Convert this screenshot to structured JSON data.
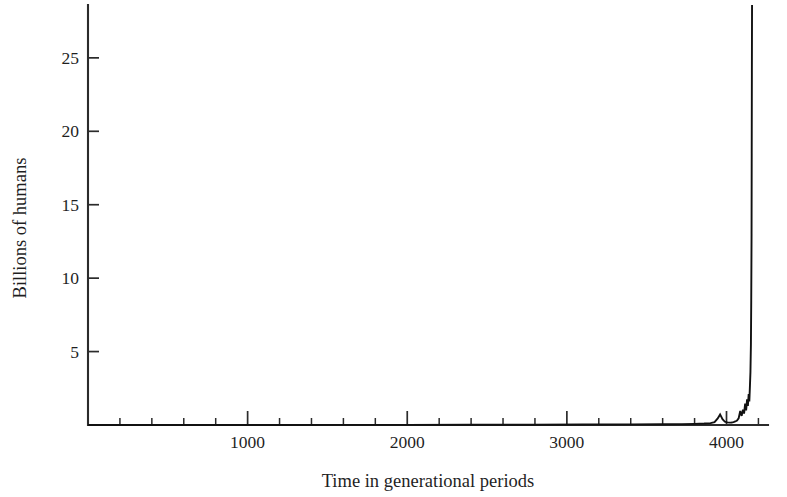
{
  "chart_data": {
    "type": "line",
    "title": "",
    "subtitle": "",
    "xlabel": "Time in generational periods",
    "ylabel": "Billions of humans",
    "xlim": [
      0,
      4260
    ],
    "ylim": [
      0,
      28.6
    ],
    "grid": false,
    "legend": null,
    "xticks": [
      1000,
      2000,
      3000,
      4000
    ],
    "xtick_labels": [
      "1000",
      "2000",
      "3000",
      "4000"
    ],
    "x_minor_tick_step": 200,
    "yticks": [
      5,
      10,
      15,
      20,
      25
    ],
    "ytick_labels": [
      "5",
      "10",
      "15",
      "20",
      "25"
    ],
    "series": [
      {
        "name": "World population",
        "color": "#111111",
        "x": [
          0,
          400,
          800,
          1200,
          1600,
          2000,
          2400,
          2800,
          3100,
          3400,
          3600,
          3720,
          3800,
          3860,
          3900,
          3925,
          3945,
          3960,
          3975,
          3990,
          4005,
          4020,
          4032,
          4044,
          4055,
          4066,
          4076,
          4086,
          4095,
          4103,
          4110,
          4117,
          4123,
          4129,
          4134,
          4139,
          4143,
          4147,
          4150,
          4153,
          4155,
          4157,
          4158,
          4159,
          4160
        ],
        "y": [
          0.0,
          0.0,
          0.0,
          0.0,
          0.01,
          0.01,
          0.02,
          0.02,
          0.03,
          0.04,
          0.05,
          0.06,
          0.08,
          0.1,
          0.13,
          0.2,
          0.45,
          0.72,
          0.4,
          0.22,
          0.18,
          0.16,
          0.17,
          0.2,
          0.24,
          0.3,
          0.45,
          0.95,
          0.62,
          1.05,
          0.78,
          1.45,
          1.0,
          1.75,
          1.3,
          2.1,
          1.6,
          2.7,
          3.6,
          5.5,
          8.5,
          13.0,
          18.5,
          24.0,
          28.6
        ]
      }
    ],
    "annotations": []
  },
  "axes": {
    "y_axis_title": "Billions of humans",
    "x_axis_title": "Time in generational periods"
  }
}
